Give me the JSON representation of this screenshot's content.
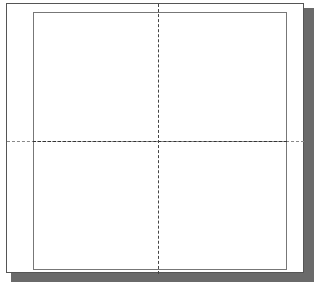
{
  "diagram": {
    "type": "page-layout-grid",
    "guides": [
      {
        "orientation": "vertical"
      },
      {
        "orientation": "horizontal"
      }
    ],
    "quadrants": 4
  }
}
